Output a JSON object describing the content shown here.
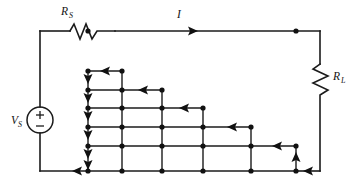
{
  "figure": {
    "kind": "circuit-schematic",
    "background_color": "#ffffff",
    "line_color": "#1b1b1b",
    "width": 353,
    "height": 185
  },
  "labels": {
    "source": {
      "symbol": "V",
      "subscript": "S"
    },
    "series_resistor": {
      "symbol": "R",
      "subscript": "S"
    },
    "load_resistor": {
      "symbol": "R",
      "subscript": "L"
    },
    "current": {
      "symbol": "I",
      "subscript": ""
    }
  },
  "components": [
    {
      "name": "voltage-source",
      "type": "independent-voltage-source",
      "label": "VS",
      "shape": "circle-with-plus-minus",
      "polarity_top": "+",
      "polarity_bottom": "−",
      "position": {
        "x": 40,
        "y": 120
      }
    },
    {
      "name": "series-resistor",
      "type": "resistor",
      "label": "RS",
      "shape": "zigzag-horizontal",
      "position": {
        "x": 70,
        "y": 31
      }
    },
    {
      "name": "load-resistor",
      "type": "resistor",
      "label": "RL",
      "shape": "zigzag-vertical",
      "position": {
        "x": 320,
        "y": 80
      }
    }
  ],
  "current_arrows": [
    {
      "name": "main-current-arrow",
      "direction": "right",
      "on": "top-rail"
    },
    {
      "name": "return-current-arrow",
      "direction": "left",
      "on": "bottom-rail"
    },
    {
      "name": "mesh-column-arrows",
      "direction": "down",
      "count": 6,
      "on": "left-mesh-column"
    },
    {
      "name": "mesh-step-arrows",
      "direction": "left",
      "count": 5,
      "on": "staircase-rows"
    },
    {
      "name": "riser-arrow",
      "direction": "up",
      "on": "rightmost-riser"
    }
  ],
  "mesh": {
    "description": "Staircase resistive mesh of node dots joined by straight conductors",
    "columns_x": [
      88,
      122,
      162,
      203,
      251,
      296
    ],
    "rows_y": [
      71,
      90,
      108,
      127,
      146,
      171
    ],
    "row_right_column_index": [
      1,
      2,
      3,
      4,
      5,
      5
    ],
    "node_count": 26
  }
}
